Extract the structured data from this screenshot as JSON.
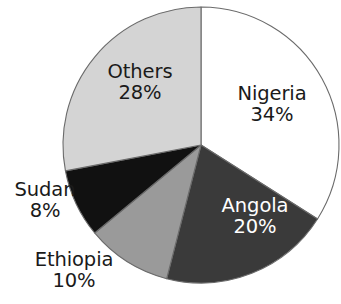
{
  "chart_data": {
    "type": "pie",
    "title": "",
    "subtitle": "",
    "xlabel": "",
    "ylabel": "",
    "legend_position": "none",
    "grid": false,
    "labels_shown": "category name and percentage",
    "start_angle_deg": 0,
    "direction": "clockwise",
    "categories": [
      "Nigeria",
      "Angola",
      "Ethiopia",
      "Sudan",
      "Others"
    ],
    "values": [
      34,
      20,
      10,
      8,
      28
    ],
    "value_unit": "%",
    "total": 100,
    "slices": [
      {
        "name": "Nigeria",
        "value": 34,
        "percent_text": "34%",
        "color": "#ffffff",
        "label_color": "#1a1a1a",
        "label_placement": "inside",
        "start_angle_deg": 0,
        "end_angle_deg": 122.4
      },
      {
        "name": "Angola",
        "value": 20,
        "percent_text": "20%",
        "color": "#3a3a3a",
        "label_color": "#ffffff",
        "label_placement": "inside",
        "start_angle_deg": 122.4,
        "end_angle_deg": 194.4
      },
      {
        "name": "Ethiopia",
        "value": 10,
        "percent_text": "10%",
        "color": "#9a9a9a",
        "label_color": "#1a1a1a",
        "label_placement": "outside",
        "start_angle_deg": 194.4,
        "end_angle_deg": 230.4
      },
      {
        "name": "Sudan",
        "value": 8,
        "percent_text": "8%",
        "color": "#111111",
        "label_color": "#1a1a1a",
        "label_placement": "outside",
        "start_angle_deg": 230.4,
        "end_angle_deg": 259.2
      },
      {
        "name": "Others",
        "value": 28,
        "percent_text": "28%",
        "color": "#d4d4d4",
        "label_color": "#1a1a1a",
        "label_placement": "inside",
        "start_angle_deg": 259.2,
        "end_angle_deg": 360
      }
    ],
    "geometry": {
      "center_x": 201,
      "center_y": 145,
      "radius": 138
    },
    "style": {
      "background": "#ffffff",
      "outline_color": "#6b6b6b"
    }
  }
}
